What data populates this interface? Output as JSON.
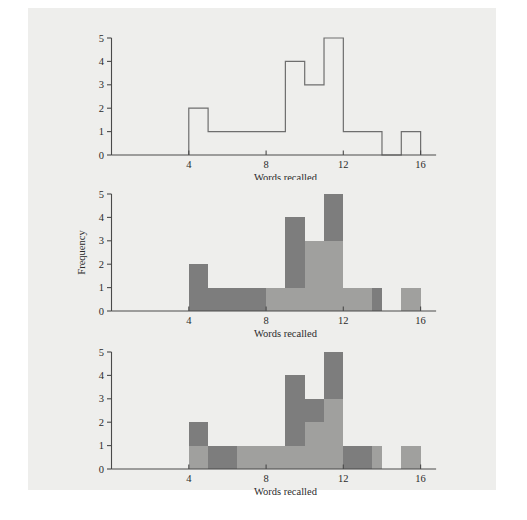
{
  "figure": {
    "background_color": "#ffffff",
    "page_color": "#eeeeec",
    "colors": {
      "axis": "#4a4a4a",
      "outline": "#6e6e6e",
      "dark_gray": "#7d7d7d",
      "light_gray": "#a0a09e",
      "text": "#2b2b2b"
    }
  },
  "chart_data": [
    {
      "type": "bar",
      "panel": "top",
      "title": "",
      "xlabel": "Words recalled",
      "ylabel": "",
      "xlim": [
        0,
        16.8
      ],
      "ylim": [
        0,
        5
      ],
      "xticks": [
        4,
        8,
        12,
        16
      ],
      "xtick_labels": [
        "4",
        "8",
        "12",
        "16"
      ],
      "yticks": [
        0,
        1,
        2,
        3,
        4,
        5
      ],
      "ytick_labels": [
        "0",
        "1",
        "2",
        "3",
        "4",
        "5"
      ],
      "grid": false,
      "legend": "none",
      "style": "outline-only",
      "bin_width": 1,
      "bin_starts": [
        4,
        5,
        6,
        7,
        8,
        9,
        10,
        11,
        12,
        13,
        14,
        15
      ],
      "values": [
        2,
        1,
        1,
        1,
        1,
        4,
        3,
        5,
        1,
        1,
        0,
        1
      ]
    },
    {
      "type": "bar",
      "panel": "middle",
      "title": "",
      "xlabel": "Words recalled",
      "ylabel": "Frequency",
      "xlim": [
        0,
        16.8
      ],
      "ylim": [
        0,
        5
      ],
      "xticks": [
        4,
        8,
        12,
        16
      ],
      "xtick_labels": [
        "4",
        "8",
        "12",
        "16"
      ],
      "yticks": [
        0,
        1,
        2,
        3,
        4,
        5
      ],
      "ytick_labels": [
        "0",
        "1",
        "2",
        "3",
        "4",
        "5"
      ],
      "grid": false,
      "legend": "none",
      "style": "two-tone-shaded",
      "bin_width": 1,
      "bin_starts": [
        4,
        5,
        6,
        7,
        8,
        9,
        10,
        11,
        12,
        13,
        14,
        15
      ],
      "values": [
        2,
        1,
        1,
        1,
        1,
        4,
        3,
        5,
        1,
        1,
        0,
        1
      ],
      "description": "Dark gray region left of 8 and upper portions; light gray overlay covers area from 8 to 13.5 below the outline plus the 15-16 bar",
      "light_overlay_spans": [
        {
          "x0": 8,
          "x1": 9,
          "y0": 0,
          "y1": 1
        },
        {
          "x0": 9,
          "x1": 10,
          "y0": 0,
          "y1": 1
        },
        {
          "x0": 10,
          "x1": 11,
          "y0": 0,
          "y1": 3
        },
        {
          "x0": 11,
          "x1": 12,
          "y0": 0,
          "y1": 3
        },
        {
          "x0": 12,
          "x1": 13,
          "y0": 0,
          "y1": 1
        },
        {
          "x0": 13,
          "x1": 13.5,
          "y0": 0,
          "y1": 1
        },
        {
          "x0": 15,
          "x1": 16,
          "y0": 0,
          "y1": 1
        }
      ]
    },
    {
      "type": "bar",
      "panel": "bottom",
      "title": "",
      "xlabel": "Words recalled",
      "ylabel": "",
      "xlim": [
        0,
        16.8
      ],
      "ylim": [
        0,
        5
      ],
      "xticks": [
        4,
        8,
        12,
        16
      ],
      "xtick_labels": [
        "4",
        "8",
        "12",
        "16"
      ],
      "yticks": [
        0,
        1,
        2,
        3,
        4,
        5
      ],
      "ytick_labels": [
        "0",
        "1",
        "2",
        "3",
        "4",
        "5"
      ],
      "grid": false,
      "legend": "none",
      "style": "two-tone-shaded",
      "bin_width": 1,
      "bin_starts": [
        4,
        5,
        6,
        7,
        8,
        9,
        10,
        11,
        12,
        13,
        14,
        15
      ],
      "values": [
        2,
        1,
        1,
        1,
        1,
        4,
        3,
        5,
        1,
        1,
        0,
        1
      ],
      "description": "Light gray fills lower region; dark gray marks the upper slice of each bar plus the 5-6.5 and 12-13.5 blocks",
      "dark_overlay_spans": [
        {
          "x0": 4,
          "x1": 5,
          "y0": 1,
          "y1": 2
        },
        {
          "x0": 5,
          "x1": 6.5,
          "y0": 0,
          "y1": 1
        },
        {
          "x0": 9,
          "x1": 10,
          "y0": 1,
          "y1": 4
        },
        {
          "x0": 10,
          "x1": 11,
          "y0": 2,
          "y1": 3
        },
        {
          "x0": 11,
          "x1": 12,
          "y0": 3,
          "y1": 5
        },
        {
          "x0": 12,
          "x1": 13.5,
          "y0": 0,
          "y1": 1
        }
      ]
    }
  ],
  "labels": {
    "x_axis_title": "Words recalled",
    "y_axis_title": "Frequency"
  }
}
